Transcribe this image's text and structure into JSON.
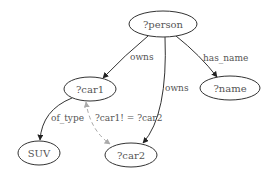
{
  "diagram": {
    "nodes": [
      {
        "id": "person",
        "label": "?person",
        "cx": 163,
        "cy": 24,
        "rx": 34,
        "ry": 13
      },
      {
        "id": "car1",
        "label": "?car1",
        "cx": 90,
        "cy": 89,
        "rx": 26,
        "ry": 12
      },
      {
        "id": "name",
        "label": "?name",
        "cx": 230,
        "cy": 88,
        "rx": 30,
        "ry": 12
      },
      {
        "id": "suv",
        "label": "SUV",
        "cx": 39,
        "cy": 153,
        "rx": 21,
        "ry": 12
      },
      {
        "id": "car2",
        "label": "?car2",
        "cx": 131,
        "cy": 155,
        "rx": 26,
        "ry": 12
      }
    ],
    "edges": [
      {
        "from": "person",
        "to": "car1",
        "label": "owns",
        "style": "solid"
      },
      {
        "from": "person",
        "to": "car2",
        "label": "owns",
        "style": "solid"
      },
      {
        "from": "person",
        "to": "name",
        "label": "has_name",
        "style": "solid"
      },
      {
        "from": "car1",
        "to": "suv",
        "label": "of_type",
        "style": "solid"
      },
      {
        "from": "car1",
        "to": "car2",
        "label": "?car1! = ?car2",
        "style": "dashed",
        "bidirectional": true
      }
    ]
  }
}
